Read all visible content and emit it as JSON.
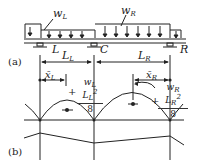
{
  "figure": {
    "panel_a_label": "(a)",
    "panel_b_label": "(b)",
    "loads": {
      "left": {
        "symbol": "w",
        "sub": "L"
      },
      "right": {
        "symbol": "w",
        "sub": "R"
      }
    },
    "supports": {
      "left": "L",
      "center": "C",
      "right": "R"
    },
    "spans": {
      "left": {
        "symbol": "L",
        "sub": "L"
      },
      "right": {
        "symbol": "L",
        "sub": "R"
      }
    },
    "centroids": {
      "left": {
        "symbol": "x̄",
        "sub": "L"
      },
      "right": {
        "symbol": "x̄",
        "sub": "R"
      }
    },
    "moments": {
      "left": {
        "sign": "+",
        "num_w": "w",
        "num_w_sub": "L",
        "num_L": "L",
        "num_L_sub": "L",
        "num_exp": "2",
        "den": "8"
      },
      "right": {
        "sign": "+",
        "num_w": "w",
        "num_w_sub": "R",
        "num_L": "L",
        "num_L_sub": "R",
        "num_exp": "2",
        "den": "8"
      }
    },
    "colors": {
      "line": "#222222",
      "background": "#ffffff"
    }
  }
}
